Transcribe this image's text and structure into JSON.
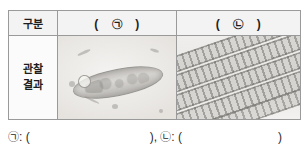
{
  "table": {
    "header": {
      "label_cell": "구분",
      "column_a": {
        "open": "(",
        "symbol": "㉠",
        "close": ")"
      },
      "column_b": {
        "open": "(",
        "symbol": "㉡",
        "close": ")"
      }
    },
    "body": {
      "row_label_line1": "관찰",
      "row_label_line2": "결과",
      "cell_a_image": "micrograph-single-celled-organism",
      "cell_b_image": "micrograph-filamentous-algae"
    }
  },
  "answer_line": {
    "symbol_a": "㉠",
    "separator_a": ": (",
    "close_a": "),",
    "symbol_b": "㉡",
    "separator_b": ": (",
    "close_b": ")"
  },
  "colors": {
    "border": "#9a9a9a",
    "header_fill": "#f3f3f3",
    "text": "#1d1d1d",
    "page": "#ffffff"
  }
}
